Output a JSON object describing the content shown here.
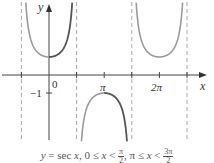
{
  "chart_data": {
    "type": "line",
    "title": "",
    "function": "y = sec x",
    "xlabel": "x",
    "ylabel": "y",
    "x_ticks": [
      {
        "value": -1.5708,
        "label": ""
      },
      {
        "value": 0,
        "label": "0"
      },
      {
        "value": 1.5708,
        "label": ""
      },
      {
        "value": 3.1416,
        "label": "π"
      },
      {
        "value": 4.7124,
        "label": ""
      },
      {
        "value": 6.2832,
        "label": "2π"
      },
      {
        "value": 7.854,
        "label": ""
      }
    ],
    "y_ticks": [
      {
        "value": -1,
        "label": "−1"
      }
    ],
    "asymptotes": [
      -1.5708,
      1.5708,
      4.7124,
      7.854
    ],
    "xlim": [
      -2.4,
      8.9
    ],
    "ylim": [
      -3.9,
      4.2
    ],
    "grid": false,
    "series": [
      {
        "name": "sec x (−π/2 < x < 0)",
        "x_range": [
          -1.5708,
          0
        ],
        "color": "#9a9a9a",
        "highlighted": false
      },
      {
        "name": "sec x (0 ≤ x < π/2)",
        "x_range": [
          0,
          1.5708
        ],
        "color": "#555555",
        "highlighted": true
      },
      {
        "name": "sec x (π/2 < x < π)",
        "x_range": [
          1.5708,
          3.1416
        ],
        "color": "#9a9a9a",
        "highlighted": false
      },
      {
        "name": "sec x (π ≤ x < 3π/2)",
        "x_range": [
          3.1416,
          4.7124
        ],
        "color": "#555555",
        "highlighted": true
      },
      {
        "name": "sec x (3π/2 < x < 5π/2)",
        "x_range": [
          4.7124,
          7.854
        ],
        "color": "#9a9a9a",
        "highlighted": false
      }
    ],
    "sample_points": [
      {
        "x": 0,
        "y": 1
      },
      {
        "x": 3.1416,
        "y": -1
      },
      {
        "x": 6.2832,
        "y": 1
      }
    ]
  },
  "axes": {
    "x_label": "x",
    "y_label": "y",
    "origin_label": "0",
    "pi_label": "π",
    "two_pi_label": "2π",
    "neg_one_label": "−1"
  },
  "caption": {
    "lhs": "y",
    "eq": " = sec ",
    "var": "x",
    "cond1_left": ", 0 ≤ ",
    "cond1_var": "x",
    "cond1_right": " < ",
    "cond1_frac_num": "π",
    "cond1_frac_den": "2",
    "cond2_left": ", π ≤ ",
    "cond2_var": "x",
    "cond2_right": " < ",
    "cond2_frac_num": "3π",
    "cond2_frac_den": "2"
  },
  "colors": {
    "axis": "#444444",
    "asymptote": "#aaaaaa",
    "curve_light": "#9a9a9a",
    "curve_dark": "#555555"
  }
}
